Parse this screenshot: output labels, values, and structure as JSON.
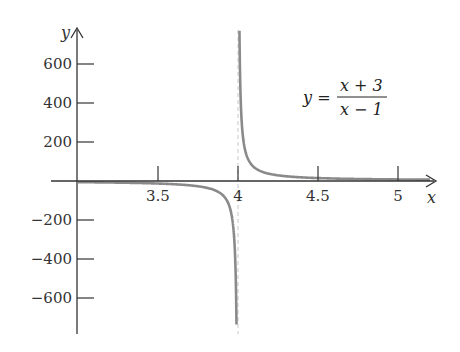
{
  "chart_data": {
    "type": "line",
    "title": "",
    "xlabel": "x",
    "ylabel": "y",
    "annotation": {
      "lhs": "y =",
      "numerator": "x + 3",
      "denominator": "x − 1"
    },
    "xlim": [
      3.0,
      5.2
    ],
    "ylim": [
      -780,
      780
    ],
    "x_ticks": [
      3.5,
      4,
      4.5,
      5
    ],
    "x_tick_labels": [
      "3.5",
      "4",
      "4.5",
      "5"
    ],
    "y_ticks": [
      600,
      400,
      200,
      -200,
      -400,
      -600
    ],
    "y_tick_labels": [
      "600",
      "400",
      "200",
      "−200",
      "−400",
      "−600"
    ],
    "grid": false,
    "legend": "none",
    "vertical_asymptote": 4,
    "series": [
      {
        "name": "left branch",
        "x": [
          3.0,
          3.5,
          3.7,
          3.8,
          3.9,
          3.95,
          3.97,
          3.98,
          3.99
        ],
        "y": [
          -6,
          -13,
          -22.3,
          -34,
          -69,
          -139,
          -232,
          -349,
          -699
        ]
      },
      {
        "name": "right branch",
        "x": [
          4.01,
          4.02,
          4.03,
          4.05,
          4.1,
          4.2,
          4.3,
          4.5,
          4.75,
          5.0,
          5.2
        ],
        "y": [
          701,
          351,
          234,
          141,
          71,
          36,
          24.3,
          15,
          10.3,
          8,
          6.8
        ]
      }
    ],
    "colors": {
      "curve": "#8a8a8a",
      "axis": "#333333",
      "asymptote": "#bbbbbb"
    }
  }
}
